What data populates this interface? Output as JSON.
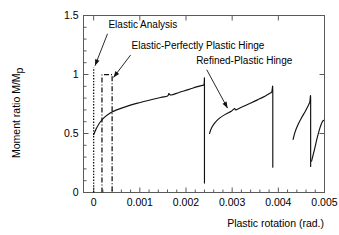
{
  "chart_data": {
    "type": "line",
    "title": "",
    "xlabel": "Plastic rotation (rad.)",
    "ylabel": "Moment ratio M/Mp",
    "ylabel_main": "Moment ratio ",
    "ylabel_italic": "M/M",
    "ylabel_sub": "p",
    "xlim": [
      -0.00022,
      0.005
    ],
    "ylim": [
      0,
      1.5
    ],
    "xticks": [
      0,
      0.001,
      0.002,
      0.003,
      0.004,
      0.005
    ],
    "xtick_labels": [
      "0",
      "0.001",
      "0.002",
      "0.003",
      "0.004",
      "0.005"
    ],
    "yticks": [
      0,
      0.5,
      1,
      1.5
    ],
    "ytick_labels": [
      "0",
      "0.5",
      "1",
      "1.5"
    ],
    "x_minor_count": 5,
    "y_minor_count": 5,
    "grid": false,
    "legend_position": "inline-annotations",
    "series": [
      {
        "name": "Elastic Analysis",
        "style": "dotted-vertical",
        "points": [
          [
            0.0,
            0.0
          ],
          [
            0.0,
            1.06
          ]
        ]
      },
      {
        "name": "Elastic-Perfectly Plastic Hinge",
        "style": "dash-dot",
        "points": [
          [
            0.00018,
            0.0
          ],
          [
            0.00018,
            1.0
          ],
          [
            0.0004,
            1.0
          ],
          [
            0.0004,
            0.0
          ]
        ]
      },
      {
        "name": "Refined-Plastic Hinge",
        "style": "solid",
        "segments": [
          {
            "comment": "cycle 1: rise from 0.5 to peak 0.91 then unload to 0.08",
            "points": [
              [
                0.0,
                0.49
              ],
              [
                5e-05,
                0.535
              ],
              [
                0.00012,
                0.585
              ],
              [
                0.00022,
                0.632
              ],
              [
                0.00035,
                0.672
              ],
              [
                0.0005,
                0.7
              ],
              [
                0.0007,
                0.728
              ],
              [
                0.00095,
                0.757
              ],
              [
                0.0012,
                0.782
              ],
              [
                0.00145,
                0.805
              ],
              [
                0.0016,
                0.818
              ],
              [
                0.00163,
                0.838
              ],
              [
                0.00168,
                0.826
              ],
              [
                0.00185,
                0.848
              ],
              [
                0.00205,
                0.872
              ],
              [
                0.00225,
                0.897
              ],
              [
                0.00238,
                0.91
              ],
              [
                0.0024,
                0.91
              ],
              [
                0.0024,
                0.08
              ]
            ]
          },
          {
            "comment": "cycle 2: restart near 0.0025 rising to 0.855 then unload to 0.215",
            "points": [
              [
                0.00251,
                0.5
              ],
              [
                0.00255,
                0.545
              ],
              [
                0.00262,
                0.588
              ],
              [
                0.00272,
                0.628
              ],
              [
                0.00285,
                0.662
              ],
              [
                0.00298,
                0.689
              ],
              [
                0.00305,
                0.712
              ],
              [
                0.00308,
                0.7
              ],
              [
                0.0032,
                0.722
              ],
              [
                0.00338,
                0.754
              ],
              [
                0.00355,
                0.785
              ],
              [
                0.00372,
                0.818
              ],
              [
                0.00385,
                0.848
              ],
              [
                0.00388,
                0.855
              ],
              [
                0.00388,
                0.215
              ]
            ]
          },
          {
            "comment": "cycle 3: restart near 0.0043 rising to 0.785 then unload to 0.22",
            "points": [
              [
                0.00432,
                0.45
              ],
              [
                0.00436,
                0.51
              ],
              [
                0.00442,
                0.57
              ],
              [
                0.0045,
                0.632
              ],
              [
                0.00458,
                0.685
              ],
              [
                0.00464,
                0.73
              ],
              [
                0.00468,
                0.762
              ],
              [
                0.0047,
                0.785
              ],
              [
                0.0047,
                0.22
              ]
            ]
          },
          {
            "comment": "cycle 4 partial: final short rise at right edge",
            "points": [
              [
                0.00472,
                0.265
              ],
              [
                0.00478,
                0.36
              ],
              [
                0.00484,
                0.46
              ],
              [
                0.0049,
                0.545
              ],
              [
                0.00495,
                0.597
              ],
              [
                0.00498,
                0.612
              ]
            ]
          }
        ]
      }
    ],
    "annotations": [
      {
        "label": "Elastic Analysis",
        "text_x": 0.00032,
        "text_y": 1.395,
        "arrow_from": [
          0.0003,
          1.345
        ],
        "arrow_to": [
          3e-05,
          1.075
        ]
      },
      {
        "label": "Elastic-Perfectly Plastic Hinge",
        "text_x": 0.00082,
        "text_y": 1.215,
        "arrow_from": [
          0.0008,
          1.165
        ],
        "arrow_to": [
          0.00043,
          0.975
        ]
      },
      {
        "label": "Refined-Plastic Hinge",
        "text_x": 0.00222,
        "text_y": 1.09,
        "arrow_from": [
          0.00245,
          1.04
        ],
        "arrow_to": [
          0.0029,
          0.715
        ]
      }
    ]
  },
  "figure": {
    "background_color": "#ffffff",
    "curve_color": "#111111",
    "axis_color": "#5a5a5a"
  }
}
